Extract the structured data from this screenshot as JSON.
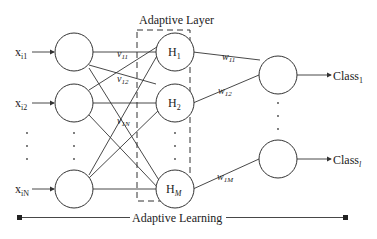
{
  "diagram": {
    "title": "Adaptive Layer",
    "bottom_label": "Adaptive Learning",
    "inputs": [
      {
        "base": "x",
        "sub": "i1"
      },
      {
        "base": "x",
        "sub": "i2"
      },
      {
        "base": "x",
        "sub": "iN"
      }
    ],
    "hidden": [
      {
        "base": "H",
        "sub": "1"
      },
      {
        "base": "H",
        "sub": "2"
      },
      {
        "base": "H",
        "sub": "M"
      }
    ],
    "outputs": [
      {
        "base": "Class",
        "sub": "1"
      },
      {
        "base": "Class",
        "sub": "l"
      }
    ],
    "input_weights": [
      {
        "base": "v",
        "sub": "11"
      },
      {
        "base": "v",
        "sub": "12"
      },
      {
        "base": "v",
        "sub": "1N"
      }
    ],
    "output_weights": [
      {
        "base": "w",
        "sub": "11"
      },
      {
        "base": "w",
        "sub": "12"
      },
      {
        "base": "w",
        "sub": "1M"
      }
    ],
    "colors": {
      "line": "#333333",
      "text": "#222222",
      "background": "#ffffff"
    }
  }
}
